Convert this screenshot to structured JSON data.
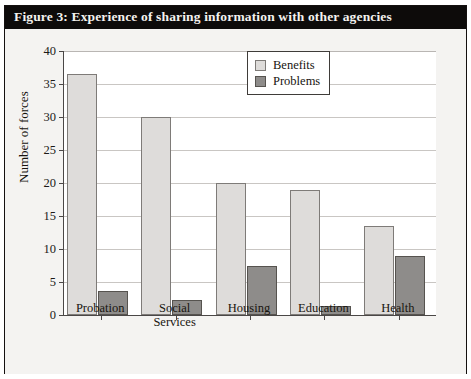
{
  "figure": {
    "title": "Figure 3: Experience of sharing information with other agencies"
  },
  "legend": {
    "position": "top-right",
    "entries": [
      {
        "label": "Benefits",
        "color": "#dedcda"
      },
      {
        "label": "Problems",
        "color": "#8e8c8a"
      }
    ]
  },
  "axes": {
    "ylabel": "Number of forces",
    "yticks": [
      "0",
      "5",
      "10",
      "15",
      "20",
      "25",
      "30",
      "35",
      "40"
    ]
  },
  "chart_data": {
    "type": "bar",
    "title": "Figure 3: Experience of sharing information with other agencies",
    "xlabel": "",
    "ylabel": "Number of forces",
    "ylim": [
      0,
      40
    ],
    "ytick_step": 5,
    "grid": true,
    "legend_position": "top-right",
    "categories": [
      "Probation",
      "Social Services",
      "Housing",
      "Education",
      "Health"
    ],
    "category_lines": [
      [
        "Probation"
      ],
      [
        "Social",
        "Services"
      ],
      [
        "Housing"
      ],
      [
        "Education"
      ],
      [
        "Health"
      ]
    ],
    "series": [
      {
        "name": "Benefits",
        "color": "#dedcda",
        "values": [
          36.5,
          30,
          20,
          19,
          13.5
        ]
      },
      {
        "name": "Problems",
        "color": "#8e8c8a",
        "values": [
          3.7,
          2.2,
          7.5,
          1.3,
          9
        ]
      }
    ]
  }
}
